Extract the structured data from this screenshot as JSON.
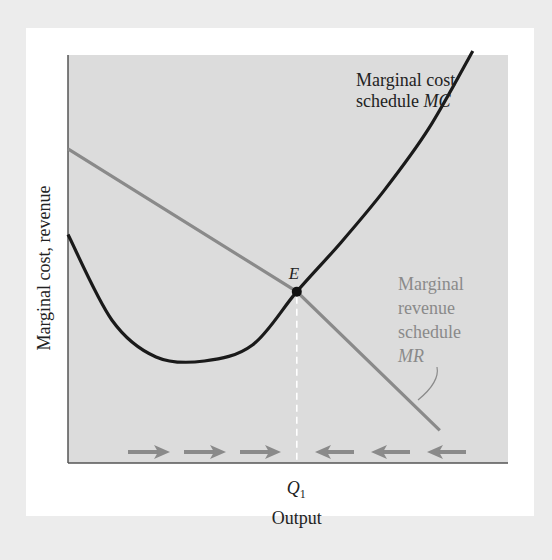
{
  "chart_data": {
    "type": "line",
    "title": "",
    "xlabel": "Output",
    "ylabel": "Marginal cost, revenue",
    "xlim": [
      0,
      100
    ],
    "ylim": [
      0,
      100
    ],
    "grid": false,
    "x_ticks": [
      {
        "label": "Q",
        "subscript": "1",
        "x": 52
      }
    ],
    "series": [
      {
        "name": "MC",
        "label_lines": [
          "Marginal cost",
          "schedule "
        ],
        "label_italic": "MC",
        "color": "#1a1a1a",
        "shape": "u-curve",
        "points": [
          [
            0,
            56
          ],
          [
            10,
            35
          ],
          [
            20,
            26
          ],
          [
            31,
            25
          ],
          [
            42,
            29
          ],
          [
            52,
            42
          ],
          [
            62,
            54
          ],
          [
            72,
            67
          ],
          [
            82,
            82
          ],
          [
            92,
            101
          ]
        ]
      },
      {
        "name": "MR",
        "label_lines": [
          "Marginal",
          "revenue",
          "schedule"
        ],
        "label_italic": "MR",
        "color": "#8a8a8a",
        "shape": "line",
        "points": [
          [
            0,
            77
          ],
          [
            52,
            42
          ],
          [
            84.5,
            8
          ]
        ]
      }
    ],
    "annotations": [
      {
        "type": "point",
        "label": "E",
        "x": 52,
        "y": 42
      },
      {
        "type": "dashed-vline",
        "x": 52,
        "from_y": 0,
        "to_y": 42
      },
      {
        "type": "arrows-right",
        "count": 3,
        "between_x": [
          14,
          50
        ]
      },
      {
        "type": "arrows-left",
        "count": 3,
        "between_x": [
          58,
          94
        ]
      }
    ]
  },
  "colors": {
    "plot_bg": "#dcdcdc",
    "mc": "#1a1a1a",
    "mr": "#8a8a8a",
    "mr_label": "#8a8a8a",
    "arrow": "#8a8a8a"
  }
}
